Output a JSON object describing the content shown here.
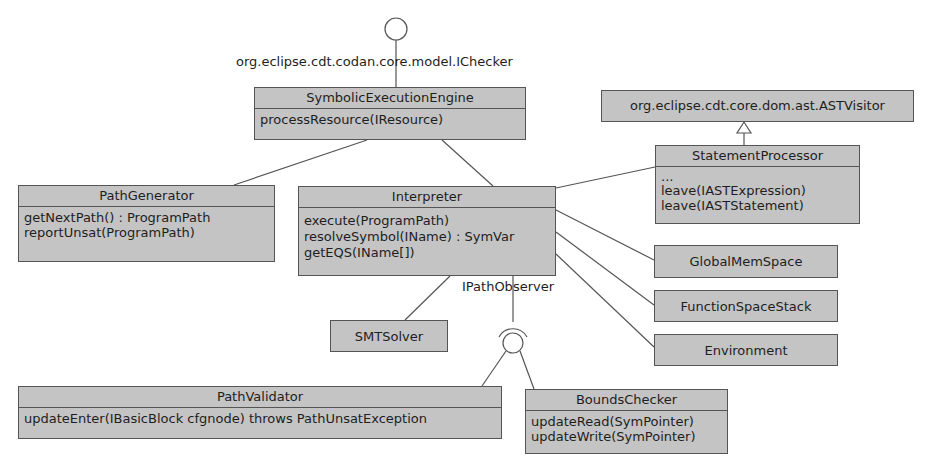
{
  "diagram": {
    "type": "uml-class-diagram",
    "interfaces": {
      "ichecker": "org.eclipse.cdt.codan.core.model.IChecker",
      "ipathobserver": "IPathObserver"
    },
    "classes": {
      "engine": {
        "name": "SymbolicExecutionEngine",
        "methods": [
          "processResource(IResource)"
        ]
      },
      "astvisitor": {
        "name": "org.eclipse.cdt.core.dom.ast.ASTVisitor",
        "methods": []
      },
      "statementprocessor": {
        "name": "StatementProcessor",
        "methods": [
          "...",
          "leave(IASTExpression)",
          "leave(IASTStatement)"
        ]
      },
      "pathgenerator": {
        "name": "PathGenerator",
        "methods": [
          "getNextPath() : ProgramPath",
          "reportUnsat(ProgramPath)"
        ]
      },
      "interpreter": {
        "name": "Interpreter",
        "methods": [
          "execute(ProgramPath)",
          "resolveSymbol(IName) : SymVar",
          "getEQS(IName[])"
        ]
      },
      "globalmemspace": {
        "name": "GlobalMemSpace"
      },
      "functionspacestack": {
        "name": "FunctionSpaceStack"
      },
      "environment": {
        "name": "Environment"
      },
      "smtsolver": {
        "name": "SMTSolver"
      },
      "pathvalidator": {
        "name": "PathValidator",
        "methods": [
          "updateEnter(IBasicBlock cfgnode) throws PathUnsatException"
        ]
      },
      "boundschecker": {
        "name": "BoundsChecker",
        "methods": [
          "updateRead(SymPointer)",
          "updateWrite(SymPointer)"
        ]
      }
    },
    "relations": [
      {
        "from": "SymbolicExecutionEngine",
        "to": "org.eclipse.cdt.codan.core.model.IChecker",
        "kind": "provided-interface"
      },
      {
        "from": "SymbolicExecutionEngine",
        "to": "PathGenerator",
        "kind": "association"
      },
      {
        "from": "SymbolicExecutionEngine",
        "to": "Interpreter",
        "kind": "association"
      },
      {
        "from": "StatementProcessor",
        "to": "org.eclipse.cdt.core.dom.ast.ASTVisitor",
        "kind": "generalization"
      },
      {
        "from": "Interpreter",
        "to": "StatementProcessor",
        "kind": "association"
      },
      {
        "from": "Interpreter",
        "to": "GlobalMemSpace",
        "kind": "association"
      },
      {
        "from": "Interpreter",
        "to": "FunctionSpaceStack",
        "kind": "association"
      },
      {
        "from": "Interpreter",
        "to": "Environment",
        "kind": "association"
      },
      {
        "from": "Interpreter",
        "to": "SMTSolver",
        "kind": "association"
      },
      {
        "from": "Interpreter",
        "to": "IPathObserver",
        "kind": "required-interface"
      },
      {
        "from": "PathValidator",
        "to": "IPathObserver",
        "kind": "provided-interface"
      },
      {
        "from": "BoundsChecker",
        "to": "IPathObserver",
        "kind": "provided-interface"
      }
    ]
  }
}
